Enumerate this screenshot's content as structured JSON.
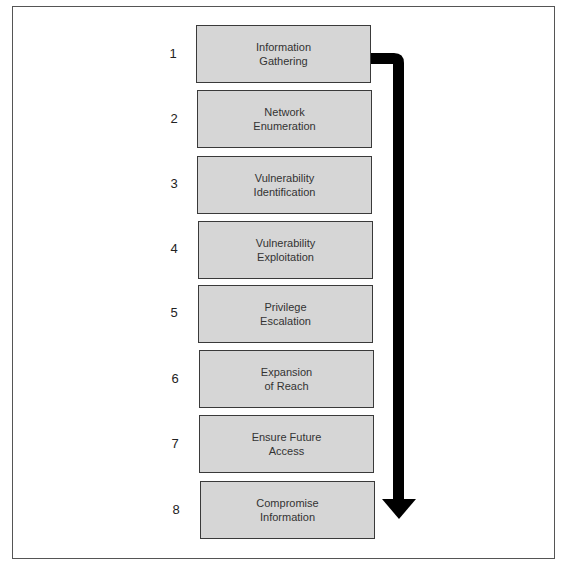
{
  "diagram": {
    "steps": [
      {
        "number": "1",
        "label": "Information\nGathering"
      },
      {
        "number": "2",
        "label": "Network\nEnumeration"
      },
      {
        "number": "3",
        "label": "Vulnerability\nIdentification"
      },
      {
        "number": "4",
        "label": "Vulnerability\nExploitation"
      },
      {
        "number": "5",
        "label": "Privilege\nEscalation"
      },
      {
        "number": "6",
        "label": "Expansion\nof Reach"
      },
      {
        "number": "7",
        "label": "Ensure Future\nAccess"
      },
      {
        "number": "8",
        "label": "Compromise\nInformation"
      }
    ],
    "arrow": {
      "direction": "down",
      "color": "#000000"
    },
    "box_fill": "#d6d6d6"
  }
}
